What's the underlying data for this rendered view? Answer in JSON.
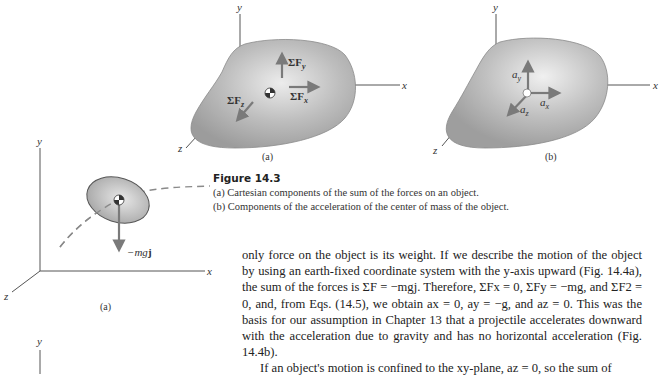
{
  "figure_14_3": {
    "title": "Figure 14.3",
    "caption_a": "(a) Cartesian components of the sum of the forces on an object.",
    "caption_b": "(b) Components of the acceleration of the center of mass of the object.",
    "panel_a": {
      "label": "(a)",
      "axes": {
        "x": "x",
        "y": "y",
        "z": "z"
      },
      "vectors": [
        "ΣFy",
        "ΣFx",
        "ΣFz"
      ]
    },
    "panel_b": {
      "label": "(b)",
      "axes": {
        "x": "x",
        "y": "y",
        "z": "z"
      },
      "vectors": [
        "ay",
        "ax",
        "az"
      ]
    }
  },
  "figure_14_4": {
    "panel_a": {
      "label": "(a)",
      "axes": {
        "x": "x",
        "y": "y",
        "z": "z"
      },
      "vector": "−mgj"
    },
    "panel_b": {
      "axes": {
        "y": "y"
      }
    }
  },
  "body": {
    "paragraph_1": "only force on the object is its weight. If we describe the motion of the object by using an earth-fixed coordinate system with the y-axis upward (Fig. 14.4a), the sum of the forces is ΣF = −mgj. Therefore, ΣFx = 0, ΣFy = −mg, and ΣF2 = 0, and, from Eqs. (14.5), we obtain ax = 0, ay = −g, and az = 0. This was the basis for our assumption in Chapter 13 that a projectile accelerates downward with the acceleration due to gravity and has no horizontal acceleration (Fig. 14.4b).",
    "paragraph_2": "If an object's motion is confined to the xy-plane, az = 0, so the sum of"
  },
  "colors": {
    "body_fill": "#a9a9a9",
    "body_highlight": "#e6e6e6",
    "vector": "#7a7a7a",
    "axis": "#555555"
  }
}
